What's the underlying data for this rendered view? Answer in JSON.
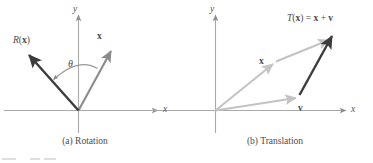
{
  "figure": {
    "panels": [
      {
        "id": "rotation",
        "caption": "(a) Rotation",
        "axes": {
          "x_label": "x",
          "y_label": "y"
        },
        "angle_label": "θ",
        "vectors": [
          {
            "name": "x",
            "label": "x",
            "color": "#8c8a8a"
          },
          {
            "name": "R(x)",
            "label_func": "R",
            "label_arg": "x",
            "color": "#3d3b3b"
          }
        ]
      },
      {
        "id": "translation",
        "caption": "(b) Translation",
        "axes": {
          "x_label": "x",
          "y_label": "y"
        },
        "vectors": [
          {
            "name": "x",
            "label": "x",
            "color": "#c3c3c3"
          },
          {
            "name": "v",
            "label": "v",
            "color": "#c3c3c3"
          },
          {
            "name": "T(x)",
            "label_func": "T",
            "label_arg": "x",
            "color": "#3d3b3b"
          }
        ],
        "result_label": {
          "func": "T",
          "arg": "x",
          "equals": "=",
          "operand_a": "x",
          "plus": "+",
          "operand_b": "v"
        }
      }
    ],
    "colors": {
      "axis": "#a9a9a9",
      "vector_dark": "#3d3b3b",
      "vector_mid": "#8c8a8a",
      "vector_light": "#c3c3c3",
      "text": "#4e4c4c",
      "background": "#ffffff"
    }
  }
}
